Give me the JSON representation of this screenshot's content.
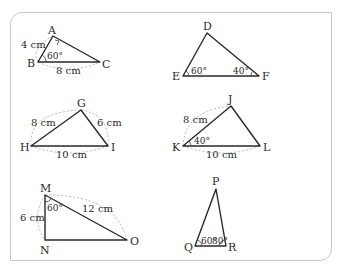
{
  "figure": {
    "triangles": [
      {
        "id": "ABC",
        "vertices": {
          "A": "A",
          "B": "B",
          "C": "C"
        },
        "sides": {
          "AB": "4 cm",
          "BC": "8 cm"
        },
        "angles": {
          "B": "60°"
        },
        "marks": {
          "A": "right-angle"
        }
      },
      {
        "id": "DEF",
        "vertices": {
          "D": "D",
          "E": "E",
          "F": "F"
        },
        "angles": {
          "E": "60°",
          "F": "40°"
        }
      },
      {
        "id": "GHI",
        "vertices": {
          "G": "G",
          "H": "H",
          "I": "I"
        },
        "sides": {
          "GH": "8 cm",
          "GI": "6 cm",
          "HI": "10 cm"
        }
      },
      {
        "id": "JKL",
        "vertices": {
          "J": "J",
          "K": "K",
          "L": "L"
        },
        "sides": {
          "JK": "8 cm",
          "KL": "10 cm"
        },
        "angles": {
          "K": "40°"
        }
      },
      {
        "id": "MNO",
        "vertices": {
          "M": "M",
          "N": "N",
          "O": "O"
        },
        "sides": {
          "MN": "6 cm",
          "MO": "12 cm"
        },
        "angles": {
          "M": "60°"
        }
      },
      {
        "id": "PQR",
        "vertices": {
          "P": "P",
          "Q": "Q",
          "R": "R"
        },
        "angles": {
          "Q": "60°",
          "R": "80°"
        }
      }
    ]
  }
}
